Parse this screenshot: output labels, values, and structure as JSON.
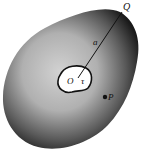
{
  "figure": {
    "labels": {
      "origin": "O",
      "inner_region": "τ",
      "radius": "a",
      "boundary_point": "Q",
      "field_point": "P"
    },
    "colors": {
      "background": "#ffffff",
      "body_dark": "#1a1a1a",
      "body_light": "#bdbdbd",
      "hole": "#ffffff",
      "ink": "#111111"
    }
  }
}
